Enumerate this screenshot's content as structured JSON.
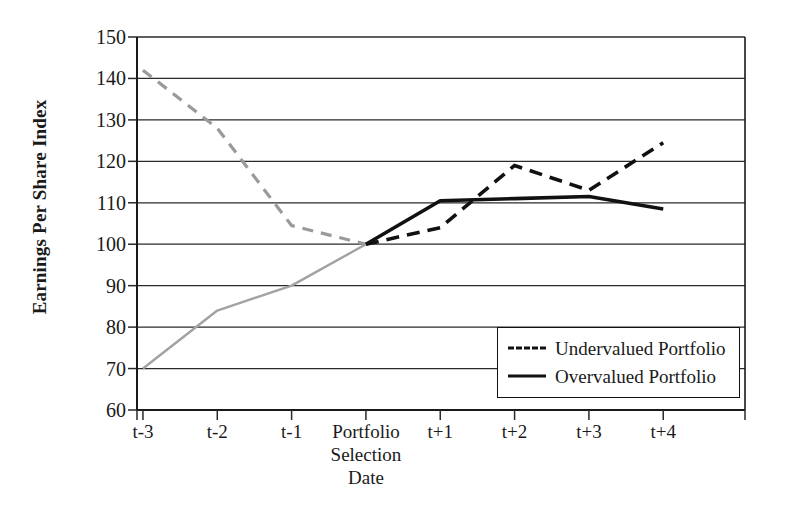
{
  "chart_data": {
    "type": "line",
    "title": "",
    "xlabel": "",
    "ylabel": "Earnings Per Share Index",
    "categories": [
      "t-3",
      "t-2",
      "t-1",
      "Portfolio\nSelection\nDate",
      "t+1",
      "t+2",
      "t+3",
      "t+4"
    ],
    "ylim": [
      60,
      150
    ],
    "yticks": [
      150,
      140,
      130,
      120,
      110,
      100,
      90,
      80,
      70,
      60
    ],
    "grid": true,
    "legend_position": "bottom-right",
    "series": [
      {
        "name": "Undervalued Portfolio",
        "style": "dashed",
        "color": "#111111",
        "values": [
          142,
          128,
          104.5,
          100,
          104,
          119,
          113,
          124.5
        ]
      },
      {
        "name": "Overvalued Portfolio",
        "style": "solid",
        "color": "#111111",
        "values": [
          70,
          84,
          90,
          100,
          110.5,
          111,
          111.5,
          108.5
        ]
      }
    ]
  },
  "axes": {
    "y_title": "Earnings Per Share Index",
    "y_tick_labels": [
      "150",
      "140",
      "130",
      "120",
      "110",
      "100",
      "90",
      "80",
      "70",
      "60"
    ],
    "x_tick_labels": [
      "t-3",
      "t-2",
      "t-1",
      "Portfolio\nSelection\nDate",
      "t+1",
      "t+2",
      "t+3",
      "t+4"
    ]
  },
  "legend": {
    "items": [
      {
        "label": "Undervalued Portfolio",
        "style": "dashed"
      },
      {
        "label": "Overvalued Portfolio",
        "style": "solid"
      }
    ]
  }
}
